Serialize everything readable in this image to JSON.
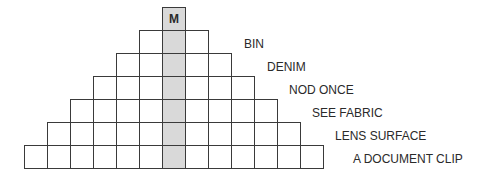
{
  "diagram": {
    "type": "letter-pyramid",
    "cell_size": 23,
    "center_column_highlight_color": "#d9d9d9",
    "top_letter": "M",
    "rows": [
      {
        "cells": 1,
        "left": 162,
        "top": 7,
        "clue": ""
      },
      {
        "cells": 3,
        "left": 139,
        "top": 30,
        "clue": "BIN"
      },
      {
        "cells": 5,
        "left": 116,
        "top": 53,
        "clue": "DENIM"
      },
      {
        "cells": 7,
        "left": 93,
        "top": 76,
        "clue": "NOD ONCE"
      },
      {
        "cells": 9,
        "left": 70,
        "top": 99,
        "clue": "SEE FABRIC"
      },
      {
        "cells": 11,
        "left": 47,
        "top": 122,
        "clue": "LENS SURFACE"
      },
      {
        "cells": 13,
        "left": 24,
        "top": 145,
        "clue": "A DOCUMENT CLIP"
      }
    ],
    "clue_positions": [
      {
        "left": 244,
        "top": 37
      },
      {
        "left": 267,
        "top": 60
      },
      {
        "left": 289,
        "top": 83
      },
      {
        "left": 312,
        "top": 106
      },
      {
        "left": 335,
        "top": 129
      },
      {
        "left": 353,
        "top": 152
      }
    ]
  }
}
